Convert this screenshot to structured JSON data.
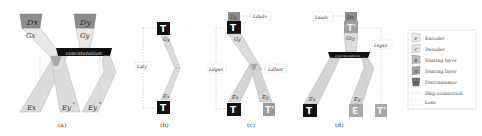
{
  "figure": {
    "panels": [
      {
        "id": "a",
        "caption": "(a)",
        "labels": {
          "dx": "Dx",
          "dy": "Dy",
          "gx": "Gx",
          "gy": "Gy",
          "ex": "Ex",
          "eyc": "Ey",
          "eyc_sup": "c",
          "eys": "Ey",
          "eys_sup": "s"
        },
        "concat": "concatenation"
      },
      {
        "id": "b",
        "caption": "(b)",
        "labels": {
          "gy": "Gy",
          "ex": "Ex",
          "t_top": "T",
          "t_bottom": "T"
        },
        "loss": "Lgly"
      },
      {
        "id": "c",
        "caption": "(c)",
        "labels": {
          "dy": "Dy",
          "gy": "Gy",
          "ex": "Ex",
          "ey": "Ey",
          "t_top": "T",
          "t_bottom": "T",
          "t_prime": "T'"
        },
        "losses": {
          "dadv": "Ldadv",
          "dgsn": "Ldgsn",
          "dfeat": "Ldfeat"
        }
      },
      {
        "id": "d",
        "caption": "(d)",
        "labels": {
          "ds": "Ds",
          "gty": "Gty",
          "ex": "Ex",
          "ey": "Ey",
          "t_prime": "T'",
          "t_left": "T",
          "e_mid": "E",
          "t_right": "T'"
        },
        "concat": "concatenation",
        "losses": {
          "sadv": "Lsadv",
          "sgsn": "Lsgsn"
        }
      }
    ],
    "legend": [
      {
        "glyph": "E",
        "label": "Encoder"
      },
      {
        "glyph": "C",
        "label": "Decoder"
      },
      {
        "glyph": "E",
        "label": "Sharing layer"
      },
      {
        "glyph": "G",
        "label": "Sharing layer"
      },
      {
        "glyph": "D",
        "label": "Discriminator"
      },
      {
        "glyph": "",
        "label": "Skip connection"
      },
      {
        "glyph": "",
        "label": "Loss"
      }
    ],
    "colors": {
      "light": "#e6e6e6",
      "mid": "#c4c4c4",
      "dark": "#8a8a8a",
      "black": "#111111",
      "disc": "#7a7a7a"
    }
  }
}
